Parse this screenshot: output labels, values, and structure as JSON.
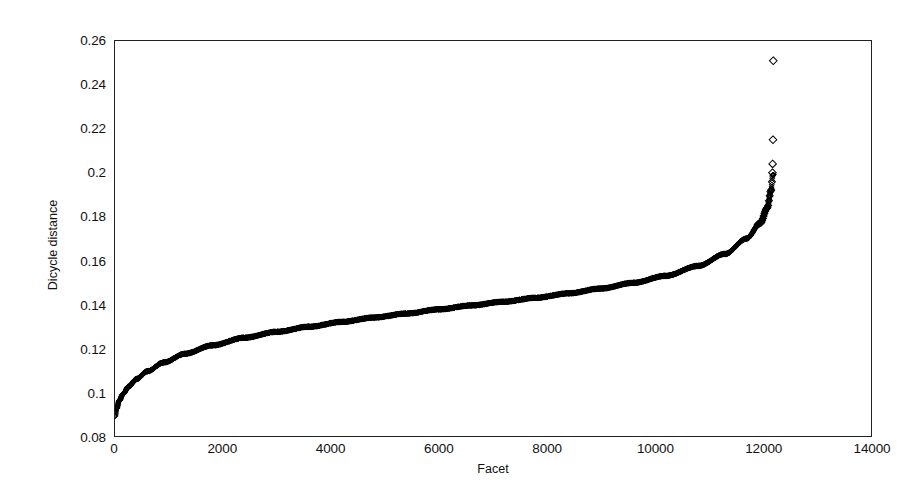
{
  "chart_data": {
    "type": "scatter",
    "title": "",
    "xlabel": "Facet",
    "ylabel": "Dicycle distance",
    "xlim": [
      0,
      14000
    ],
    "ylim": [
      0.08,
      0.26
    ],
    "xticks": [
      0,
      2000,
      4000,
      6000,
      8000,
      10000,
      12000,
      14000
    ],
    "xticklabels": [
      "0",
      "2000",
      "4000",
      "6000",
      "8000",
      "10000",
      "12000",
      "14000"
    ],
    "yticks": [
      0.08,
      0.1,
      0.12,
      0.14,
      0.16,
      0.18,
      0.2,
      0.22,
      0.24,
      0.26
    ],
    "yticklabels": [
      "0.08",
      "0.1",
      "0.12",
      "0.14",
      "0.16",
      "0.18",
      "0.2",
      "0.22",
      "0.24",
      "0.26"
    ],
    "grid": false,
    "legend": null,
    "marker": "diamond-open",
    "marker_color": "#000000",
    "marker_size": 4,
    "n_points": 12200,
    "series": [
      {
        "name": "Dicycle distance",
        "curve_anchors_x": [
          0,
          30,
          80,
          150,
          250,
          400,
          600,
          900,
          1300,
          1800,
          2400,
          3000,
          3600,
          4200,
          4800,
          5400,
          6000,
          6600,
          7200,
          7800,
          8400,
          9000,
          9600,
          10200,
          10800,
          11300,
          11700,
          11950,
          12080,
          12150,
          12180
        ],
        "curve_anchors_y": [
          0.089,
          0.0925,
          0.0962,
          0.0992,
          0.1025,
          0.106,
          0.1095,
          0.1135,
          0.1175,
          0.1213,
          0.1248,
          0.1275,
          0.1298,
          0.132,
          0.134,
          0.1358,
          0.1377,
          0.1395,
          0.1412,
          0.143,
          0.145,
          0.1472,
          0.1498,
          0.153,
          0.1575,
          0.163,
          0.17,
          0.177,
          0.184,
          0.192,
          0.199
        ]
      }
    ],
    "outliers": [
      {
        "x": 12175,
        "y": 0.2
      },
      {
        "x": 12178,
        "y": 0.204
      },
      {
        "x": 12185,
        "y": 0.215
      },
      {
        "x": 12190,
        "y": 0.251
      }
    ]
  },
  "axes": {
    "x_title": "Facet",
    "y_title": "Dicycle distance"
  }
}
